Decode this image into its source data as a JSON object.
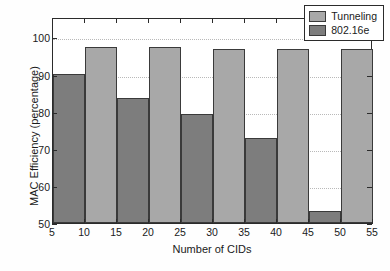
{
  "chart_data": {
    "type": "bar",
    "title": "",
    "xlabel": "Number of CIDs",
    "ylabel": "MAC Efficiency (percentage)",
    "categories": [
      10,
      20,
      30,
      40,
      50
    ],
    "series": [
      {
        "name": "Tunneling",
        "color": "#a8a8a8",
        "values": [
          97.3,
          97.3,
          96.8,
          96.8,
          96.8
        ]
      },
      {
        "name": "802.16e",
        "color": "#7d7d7d",
        "values": [
          90.2,
          83.8,
          79.5,
          72.9,
          53.2
        ]
      }
    ],
    "xlim": [
      5,
      55
    ],
    "ylim": [
      50,
      105.5
    ],
    "xticks": [
      5,
      10,
      15,
      20,
      25,
      30,
      35,
      40,
      45,
      50,
      55
    ],
    "yticks": [
      50,
      60,
      70,
      80,
      90,
      100
    ],
    "xticklabels": [
      "5",
      "10",
      "15",
      "20",
      "25",
      "30",
      "35",
      "40",
      "45",
      "50",
      "55"
    ],
    "yticklabels": [
      "50",
      "60",
      "70",
      "80",
      "90",
      "100"
    ],
    "grid": "horizontal-dotted",
    "legend_position": "top-right",
    "bar_group_width": 10,
    "bar_width": 5
  },
  "legend": {
    "entries": [
      {
        "label": "Tunneling",
        "swatch": "light"
      },
      {
        "label": "802.16e",
        "swatch": "dark"
      }
    ]
  },
  "axes": {
    "x_title": "Number of CIDs",
    "y_title": "MAC Efficiency (percentage)"
  }
}
